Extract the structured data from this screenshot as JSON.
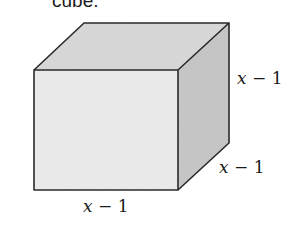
{
  "caption": {
    "partial_text": "cube."
  },
  "figure": {
    "shape": "cube",
    "colors": {
      "front_face": "#ececec",
      "top_face": "#d9d9d9",
      "side_face": "#c4c4c4",
      "edge": "#2a2a2a"
    },
    "labels": {
      "height": {
        "var": "x",
        "rest": " − 1"
      },
      "depth": {
        "var": "x",
        "rest": " − 1"
      },
      "width": {
        "var": "x",
        "rest": " − 1"
      }
    }
  }
}
